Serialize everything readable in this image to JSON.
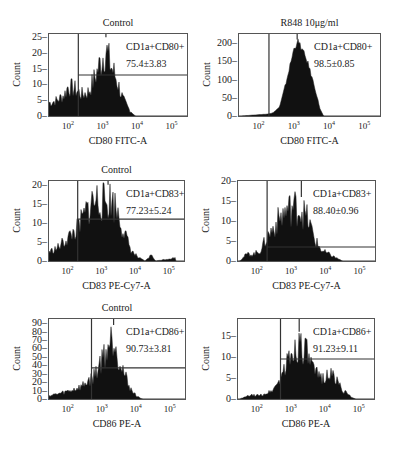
{
  "chart_data": [
    {
      "type": "histogram",
      "panel": "top-left",
      "title": "Control",
      "xlabel": "CD80 FITC-A",
      "ylabel": "Count",
      "x_scale": "log",
      "x_ticks": [
        "10^2",
        "10^3",
        "10^4",
        "10^5"
      ],
      "y_ticks": [
        0,
        5,
        10,
        15,
        20,
        25
      ],
      "ylim": [
        0,
        26
      ],
      "gate_label": "CD1a+CD80+",
      "gate_value": "75.4±3.83",
      "gate_low_log": 2.3,
      "gate_line_y": 13,
      "peak_log": 3.1,
      "peak_count": 25,
      "profile": [
        [
          1.5,
          5
        ],
        [
          1.7,
          6
        ],
        [
          1.9,
          8
        ],
        [
          2.0,
          11
        ],
        [
          2.2,
          10
        ],
        [
          2.4,
          8
        ],
        [
          2.6,
          9
        ],
        [
          2.8,
          15
        ],
        [
          3.0,
          22
        ],
        [
          3.1,
          25
        ],
        [
          3.2,
          20
        ],
        [
          3.4,
          14
        ],
        [
          3.6,
          6
        ],
        [
          3.8,
          2
        ],
        [
          3.95,
          0
        ]
      ]
    },
    {
      "type": "histogram",
      "panel": "top-right",
      "title": "R848 10μg/ml",
      "xlabel": "CD80 FITC-A",
      "ylabel": "Count",
      "x_scale": "log",
      "x_ticks": [
        "10^2",
        "10^3",
        "10^4",
        "10^5"
      ],
      "y_ticks": [
        0,
        50,
        100,
        150,
        200
      ],
      "ylim": [
        0,
        225
      ],
      "gate_label": "CD1a+CD80+",
      "gate_value": "98.5±0.85",
      "gate_low_log": 2.3,
      "peak_log": 3.1,
      "peak_count": 210,
      "profile": [
        [
          1.5,
          0
        ],
        [
          1.9,
          3
        ],
        [
          2.2,
          5
        ],
        [
          2.4,
          8
        ],
        [
          2.6,
          25
        ],
        [
          2.8,
          100
        ],
        [
          3.0,
          185
        ],
        [
          3.1,
          210
        ],
        [
          3.2,
          195
        ],
        [
          3.4,
          150
        ],
        [
          3.6,
          80
        ],
        [
          3.75,
          20
        ],
        [
          3.85,
          0
        ]
      ]
    },
    {
      "type": "histogram",
      "panel": "middle-left",
      "title": "Control",
      "xlabel": "CD83 PE-Cy7-A",
      "ylabel": "Count",
      "x_scale": "log",
      "x_ticks": [
        "10^2",
        "10^3",
        "10^4",
        "10^5"
      ],
      "y_ticks": [
        0,
        5,
        10,
        15,
        20
      ],
      "ylim": [
        0,
        21
      ],
      "gate_label": "CD1a+CD83+",
      "gate_value": "77.23±5.24",
      "gate_low_log": 2.3,
      "gate_line_y": 11,
      "peak_log": 3.2,
      "peak_count": 20,
      "profile": [
        [
          1.5,
          3
        ],
        [
          1.7,
          4
        ],
        [
          1.9,
          6
        ],
        [
          2.1,
          8
        ],
        [
          2.3,
          10
        ],
        [
          2.5,
          14
        ],
        [
          2.7,
          18
        ],
        [
          2.9,
          19
        ],
        [
          3.1,
          18
        ],
        [
          3.3,
          19
        ],
        [
          3.5,
          15
        ],
        [
          3.7,
          8
        ],
        [
          3.9,
          3
        ],
        [
          4.1,
          1
        ],
        [
          4.3,
          0
        ],
        [
          4.5,
          2
        ],
        [
          4.6,
          0
        ],
        [
          5.2,
          1
        ]
      ]
    },
    {
      "type": "histogram",
      "panel": "middle-right",
      "title": "",
      "xlabel": "CD83 PE-Cy7-A",
      "ylabel": "Count",
      "x_scale": "log",
      "x_ticks": [
        "10^2",
        "10^3",
        "10^4",
        "10^5"
      ],
      "y_ticks": [
        0,
        5,
        10,
        15,
        20
      ],
      "ylim": [
        0,
        20
      ],
      "gate_label": "CD1a+CD83+",
      "gate_value": "88.40±0.96",
      "gate_low_log": 2.3,
      "gate_line_y": 3.5,
      "peak_log": 3.3,
      "peak_count": 16,
      "profile": [
        [
          1.5,
          0
        ],
        [
          1.7,
          2
        ],
        [
          1.9,
          2
        ],
        [
          2.1,
          3
        ],
        [
          2.3,
          7
        ],
        [
          2.5,
          10
        ],
        [
          2.7,
          13
        ],
        [
          2.9,
          15
        ],
        [
          3.1,
          16
        ],
        [
          3.3,
          15
        ],
        [
          3.5,
          12
        ],
        [
          3.7,
          6
        ],
        [
          3.9,
          3
        ],
        [
          4.1,
          2
        ],
        [
          4.3,
          1
        ],
        [
          4.5,
          0
        ]
      ]
    },
    {
      "type": "histogram",
      "panel": "bottom-left",
      "title": "Control",
      "xlabel": "CD86 PE-A",
      "ylabel": "Count",
      "x_scale": "log",
      "x_ticks": [
        "10^2",
        "10^3",
        "10^4",
        "10^5"
      ],
      "y_ticks": [
        0,
        10,
        20,
        30,
        40,
        50,
        60,
        70,
        80,
        90
      ],
      "ylim": [
        0,
        95
      ],
      "gate_label": "CD1a+CD86+",
      "gate_value": "90.73±3.81",
      "gate_low_log": 2.7,
      "gate_line_y": 37,
      "peak_log": 3.35,
      "peak_count": 88,
      "profile": [
        [
          1.5,
          5
        ],
        [
          1.8,
          8
        ],
        [
          2.1,
          12
        ],
        [
          2.4,
          17
        ],
        [
          2.6,
          25
        ],
        [
          2.75,
          30
        ],
        [
          2.9,
          45
        ],
        [
          3.1,
          65
        ],
        [
          3.3,
          85
        ],
        [
          3.35,
          88
        ],
        [
          3.5,
          60
        ],
        [
          3.7,
          30
        ],
        [
          3.9,
          10
        ],
        [
          4.1,
          2
        ],
        [
          4.2,
          0
        ]
      ]
    },
    {
      "type": "histogram",
      "panel": "bottom-right",
      "title": "",
      "xlabel": "CD86 PE-A",
      "ylabel": "Count",
      "x_scale": "log",
      "x_ticks": [
        "10^2",
        "10^3",
        "10^4",
        "10^5"
      ],
      "y_ticks": [
        0,
        5,
        10,
        15
      ],
      "ylim": [
        0,
        19
      ],
      "gate_label": "CD1a+CD86+",
      "gate_value": "91.23±9.11",
      "gate_low_log": 2.7,
      "gate_line_y": 9.5,
      "peak_log": 3.25,
      "peak_count": 16,
      "profile": [
        [
          1.5,
          0
        ],
        [
          1.8,
          1
        ],
        [
          2.1,
          1
        ],
        [
          2.4,
          2
        ],
        [
          2.6,
          4
        ],
        [
          2.8,
          8
        ],
        [
          3.0,
          12
        ],
        [
          3.2,
          15
        ],
        [
          3.3,
          16
        ],
        [
          3.5,
          12
        ],
        [
          3.7,
          7
        ],
        [
          3.9,
          6
        ],
        [
          4.1,
          7
        ],
        [
          4.3,
          6
        ],
        [
          4.5,
          3
        ],
        [
          4.7,
          1
        ],
        [
          4.9,
          0
        ]
      ]
    }
  ]
}
